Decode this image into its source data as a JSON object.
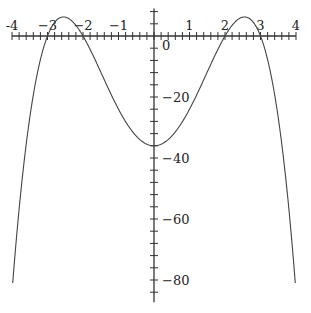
{
  "chart_data": {
    "type": "line",
    "title": "",
    "xlabel": "",
    "ylabel": "",
    "function": "f(x) = -(x^2 - 4)(x^2 - 9) = -x^4 + 13x^2 - 36",
    "xlim": [
      -4,
      4
    ],
    "ylim": [
      -86,
      9
    ],
    "grid": false,
    "x_ticks": [
      {
        "value": -4,
        "label": "-4"
      },
      {
        "value": -3,
        "label": "−3"
      },
      {
        "value": -2,
        "label": "−2"
      },
      {
        "value": -1,
        "label": "−1"
      },
      {
        "value": 1,
        "label": "1"
      },
      {
        "value": 2,
        "label": "2"
      },
      {
        "value": 3,
        "label": "3"
      },
      {
        "value": 4,
        "label": "4"
      }
    ],
    "x_minor_step": 0.2,
    "y_ticks": [
      {
        "value": 0,
        "label": "0"
      },
      {
        "value": -20,
        "label": "−20"
      },
      {
        "value": -40,
        "label": "−40"
      },
      {
        "value": -60,
        "label": "−60"
      },
      {
        "value": -80,
        "label": "−80"
      }
    ],
    "y_minor_step": 4,
    "series": [
      {
        "name": "f(x)",
        "x": [
          -3.98,
          -3.8,
          -3.6,
          -3.4,
          -3.2,
          -3.0,
          -2.8,
          -2.55,
          -2.3,
          -2.0,
          -1.6,
          -1.2,
          -0.8,
          -0.4,
          0,
          0.4,
          0.8,
          1.2,
          1.6,
          2.0,
          2.3,
          2.55,
          2.8,
          3.0,
          3.2,
          3.4,
          3.6,
          3.8,
          3.98
        ],
        "y": [
          -83.1,
          -64.8,
          -48.5,
          -34.3,
          -22.2,
          0,
          7.0,
          6.25,
          4.8,
          0,
          -9.2,
          -19.5,
          -28.1,
          -33.9,
          -36,
          -33.9,
          -28.1,
          -19.5,
          -9.2,
          0,
          4.8,
          6.25,
          7.0,
          0,
          -22.2,
          -34.3,
          -48.5,
          -64.8,
          -83.1
        ]
      }
    ]
  }
}
